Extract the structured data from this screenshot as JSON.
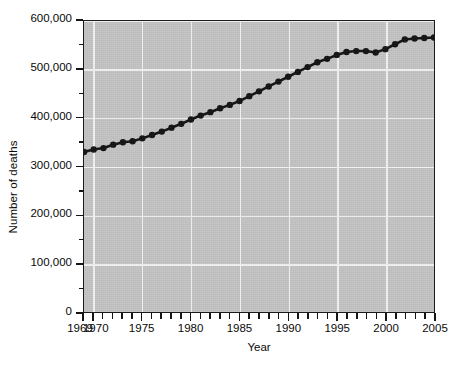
{
  "chart_data": {
    "type": "line",
    "title": "",
    "xlabel": "Year",
    "ylabel": "Number of deaths",
    "xlim": [
      1969,
      2005
    ],
    "ylim": [
      0,
      600000
    ],
    "grid": true,
    "legend": "none",
    "marker": "filled-circle",
    "line_color": "#111111",
    "plot_background": "#c3c3c3",
    "gridline_color": "#f2f2f2",
    "y_ticks_major": [
      0,
      100000,
      200000,
      300000,
      400000,
      500000,
      600000
    ],
    "y_tick_labels": [
      "0",
      "100,000",
      "200,000",
      "300,000",
      "400,000",
      "500,000",
      "600,000"
    ],
    "y_ticks_minor": [
      50000,
      150000,
      250000,
      350000,
      450000,
      550000
    ],
    "x_ticks_major": [
      1969,
      1970,
      1975,
      1980,
      1985,
      1990,
      1995,
      2000,
      2005
    ],
    "x_tick_labels": [
      "1969",
      "1970",
      "1975",
      "1980",
      "1985",
      "1990",
      "1995",
      "2000",
      "2005"
    ],
    "x_ticks_all": [
      1969,
      1970,
      1971,
      1972,
      1973,
      1974,
      1975,
      1976,
      1977,
      1978,
      1979,
      1980,
      1981,
      1982,
      1983,
      1984,
      1985,
      1986,
      1987,
      1988,
      1989,
      1990,
      1991,
      1992,
      1993,
      1994,
      1995,
      1996,
      1997,
      1998,
      1999,
      2000,
      2001,
      2002,
      2003,
      2004,
      2005
    ],
    "x": [
      1969,
      1970,
      1971,
      1972,
      1973,
      1974,
      1975,
      1976,
      1977,
      1978,
      1979,
      1980,
      1981,
      1982,
      1983,
      1984,
      1985,
      1986,
      1987,
      1988,
      1989,
      1990,
      1991,
      1992,
      1993,
      1994,
      1995,
      1996,
      1997,
      1998,
      1999,
      2000,
      2001,
      2002,
      2003,
      2004,
      2005
    ],
    "values": [
      330000,
      335000,
      338000,
      345000,
      350000,
      352000,
      358000,
      365000,
      372000,
      380000,
      388000,
      397000,
      405000,
      412000,
      420000,
      427000,
      435000,
      445000,
      455000,
      465000,
      475000,
      485000,
      495000,
      505000,
      515000,
      522000,
      530000,
      536000,
      538000,
      538000,
      535000,
      542000,
      552000,
      562000,
      564000,
      565000,
      566000
    ]
  },
  "axis": {
    "ylabel": "Number of deaths",
    "xlabel": "Year"
  }
}
